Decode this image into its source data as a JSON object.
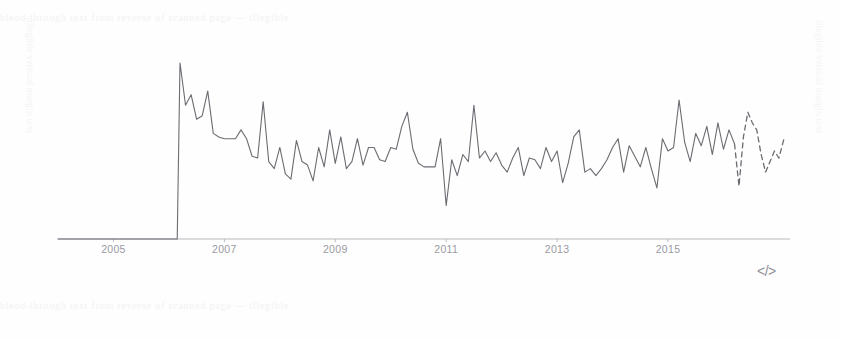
{
  "page": {
    "background_color": "#fefefe",
    "width": 841,
    "height": 339
  },
  "artifacts": {
    "ghost_top_text": "bleed-through text from reverse of scanned page — illegible",
    "ghost_bottom_text": "bleed-through text from reverse of scanned page — illegible",
    "ghost_left_column": "illegible vertical margin text",
    "ghost_right_column": "illegible vertical margin text"
  },
  "code_glyph": {
    "label": "</>",
    "name": "code-embed-icon"
  },
  "chart_data": {
    "type": "line",
    "title": "",
    "subtitle": "",
    "xlabel": "",
    "ylabel": "",
    "grid": false,
    "legend": null,
    "line_color": "#6b6b72",
    "axis_color": "#b9b9c0",
    "tick_label_color": "#9a9aa2",
    "xlim": [
      2004.0,
      2017.2
    ],
    "ylim": [
      0,
      100
    ],
    "x_tick_labels": [
      "2005",
      "2007",
      "2009",
      "2011",
      "2013",
      "2015"
    ],
    "x_tick_values": [
      2005,
      2007,
      2009,
      2011,
      2013,
      2015
    ],
    "segments": [
      {
        "name": "observed",
        "style": "solid",
        "x_start": 2004.0,
        "x_end": 2016.2
      },
      {
        "name": "projected",
        "style": "dashed",
        "x_start": 2016.2,
        "x_end": 2017.1
      }
    ],
    "series": [
      {
        "name": "value",
        "style": "solid",
        "x": [
          2004.0,
          2005.0,
          2005.5,
          2006.0,
          2006.15,
          2006.2,
          2006.3,
          2006.4,
          2006.5,
          2006.6,
          2006.7,
          2006.8,
          2006.9,
          2007.0,
          2007.1,
          2007.2,
          2007.3,
          2007.4,
          2007.5,
          2007.6,
          2007.7,
          2007.8,
          2007.9,
          2008.0,
          2008.1,
          2008.2,
          2008.3,
          2008.4,
          2008.5,
          2008.6,
          2008.7,
          2008.8,
          2008.9,
          2009.0,
          2009.1,
          2009.2,
          2009.3,
          2009.4,
          2009.5,
          2009.6,
          2009.7,
          2009.8,
          2009.9,
          2010.0,
          2010.1,
          2010.2,
          2010.3,
          2010.4,
          2010.5,
          2010.6,
          2010.7,
          2010.8,
          2010.9,
          2011.0,
          2011.1,
          2011.2,
          2011.3,
          2011.4,
          2011.5,
          2011.6,
          2011.7,
          2011.8,
          2011.9,
          2012.0,
          2012.1,
          2012.2,
          2012.3,
          2012.4,
          2012.5,
          2012.6,
          2012.7,
          2012.8,
          2012.9,
          2013.0,
          2013.1,
          2013.2,
          2013.3,
          2013.4,
          2013.5,
          2013.6,
          2013.7,
          2013.8,
          2013.9,
          2014.0,
          2014.1,
          2014.2,
          2014.3,
          2014.4,
          2014.5,
          2014.6,
          2014.7,
          2014.8,
          2014.9,
          2015.0,
          2015.1,
          2015.2,
          2015.3,
          2015.4,
          2015.5,
          2015.6,
          2015.7,
          2015.8,
          2015.9,
          2016.0,
          2016.1,
          2016.2
        ],
        "y": [
          0,
          0,
          0,
          0,
          0,
          100,
          76,
          82,
          68,
          70,
          84,
          60,
          58,
          57,
          57,
          57,
          62,
          57,
          47,
          46,
          78,
          44,
          40,
          52,
          37,
          34,
          56,
          44,
          42,
          33,
          52,
          41,
          62,
          43,
          58,
          40,
          44,
          57,
          42,
          52,
          52,
          45,
          44,
          52,
          51,
          64,
          72,
          51,
          43,
          41,
          41,
          41,
          57,
          19,
          45,
          36,
          48,
          44,
          76,
          46,
          50,
          44,
          49,
          42,
          38,
          46,
          52,
          36,
          46,
          45,
          40,
          52,
          44,
          50,
          32,
          43,
          58,
          62,
          38,
          40,
          36,
          40,
          45,
          52,
          57,
          38,
          53,
          47,
          41,
          52,
          40,
          29,
          57,
          50,
          52,
          79,
          55,
          44,
          60,
          53,
          64,
          48,
          66,
          51,
          62,
          54
        ]
      },
      {
        "name": "value (projected)",
        "style": "dashed",
        "x": [
          2016.2,
          2016.28,
          2016.36,
          2016.44,
          2016.52,
          2016.6,
          2016.68,
          2016.76,
          2016.84,
          2016.92,
          2017.0,
          2017.1
        ],
        "y": [
          54,
          30,
          58,
          72,
          66,
          62,
          48,
          38,
          44,
          50,
          46,
          58
        ]
      }
    ]
  }
}
